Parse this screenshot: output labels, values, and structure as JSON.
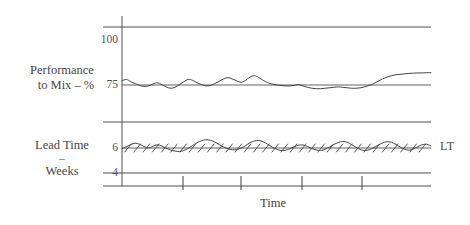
{
  "figure": {
    "background": "#ffffff",
    "ink_color": "#55514f",
    "line_color": "#3f3b39"
  },
  "labels": {
    "performance_axis": {
      "line1": "Performance",
      "line2": "to Mix – %"
    },
    "lead_time_axis": {
      "line1": "Lead Time",
      "line2": "–",
      "line3": "Weeks"
    },
    "x_axis": "Time",
    "series_lt": "LT"
  },
  "ticks": {
    "performance": [
      "100",
      "75"
    ],
    "lead_time": [
      "6",
      "4"
    ]
  },
  "chart_data": {
    "type": "line",
    "title": "",
    "xlabel": "Time",
    "grid": false,
    "legend": "right-inline",
    "panels": [
      {
        "name": "performance-to-mix",
        "ylabel": "Performance to Mix – %",
        "ytick_values": [
          100,
          75
        ],
        "ylim": [
          68,
          104
        ],
        "reference_line": 75,
        "series": [
          {
            "name": "Performance to Mix",
            "values": [
              76.8,
              77.4,
              76.4,
              75.6,
              74.8,
              74.4,
              74.6,
              75.4,
              76.0,
              75.2,
              74.2,
              73.6,
              74.0,
              75.2,
              76.4,
              77.4,
              77.0,
              76.0,
              75.2,
              74.6,
              74.8,
              75.6,
              76.6,
              77.6,
              78.2,
              77.6,
              76.8,
              76.2,
              77.0,
              78.4,
              79.0,
              78.2,
              77.0,
              76.0,
              75.4,
              75.0,
              74.8,
              74.6,
              74.6,
              74.8,
              75.2,
              74.6,
              74.0,
              73.6,
              73.4,
              73.4,
              73.6,
              73.8,
              74.0,
              74.2,
              74.0,
              73.8,
              73.6,
              73.6,
              73.8,
              74.2,
              74.8,
              75.6,
              76.6,
              77.6,
              78.4,
              79.0,
              79.4,
              79.6,
              79.8,
              80.0,
              80.1,
              80.2,
              80.2,
              80.3,
              80.3
            ]
          }
        ]
      },
      {
        "name": "lead-time",
        "ylabel": "Lead Time – Weeks",
        "ytick_values": [
          6,
          4
        ],
        "ylim": [
          3.2,
          7.6
        ],
        "reference_line": 6,
        "series": [
          {
            "name": "LT",
            "marker": "hatch-slash",
            "values": [
              5.95,
              6.1,
              6.28,
              6.38,
              6.3,
              6.12,
              6.0,
              6.14,
              6.26,
              6.16,
              5.98,
              5.84,
              5.76,
              5.72,
              5.8,
              5.98,
              6.2,
              6.42,
              6.58,
              6.66,
              6.62,
              6.48,
              6.28,
              6.08,
              5.94,
              5.86,
              5.88,
              6.0,
              6.2,
              6.42,
              6.56,
              6.6,
              6.5,
              6.3,
              6.08,
              5.9,
              5.8,
              5.82,
              5.94,
              6.1,
              6.22,
              6.24,
              6.12,
              5.96,
              5.84,
              5.8,
              5.9,
              6.08,
              6.28,
              6.44,
              6.52,
              6.46,
              6.28,
              6.06,
              5.88,
              5.8,
              5.86,
              6.02,
              6.22,
              6.4,
              6.5,
              6.46,
              6.3,
              6.08,
              5.9,
              5.82,
              5.92,
              6.1,
              6.26,
              6.3,
              6.16
            ]
          }
        ]
      }
    ],
    "x_tick_positions": [
      183,
      241,
      302,
      362
    ]
  }
}
